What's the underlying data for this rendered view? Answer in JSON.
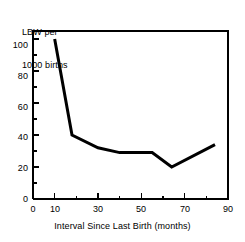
{
  "chart_data": {
    "type": "line",
    "title": "",
    "ylabel_lines": [
      "LBW per",
      "1000 births"
    ],
    "ylabel": "LBW per 1000 births",
    "xlabel": "Interval Since Last Birth (months)",
    "xlim": [
      0,
      90
    ],
    "ylim": [
      0,
      105
    ],
    "grid": false,
    "legend": null,
    "x_ticks_major": [
      0,
      10,
      30,
      50,
      70,
      90
    ],
    "x_tick_labels": [
      "0",
      "10",
      "30",
      "50",
      "70",
      "90"
    ],
    "x_ticks_minor": [
      20,
      40,
      60,
      80
    ],
    "y_ticks_major": [
      0,
      20,
      40,
      60,
      80,
      100
    ],
    "y_tick_labels": [
      "0",
      "20",
      "40",
      "60",
      "80",
      "100"
    ],
    "y_ticks_minor": [
      10,
      30,
      50,
      70,
      90
    ],
    "series": [
      {
        "name": "LBW rate",
        "color": "#000000",
        "line_width": 3,
        "x": [
          10,
          18,
          30,
          40,
          55,
          64,
          84
        ],
        "y": [
          100,
          40,
          32,
          29,
          29,
          20,
          34
        ]
      }
    ]
  },
  "axes": {
    "frame_color": "#000000",
    "frame_width": 2,
    "background": "#ffffff"
  }
}
